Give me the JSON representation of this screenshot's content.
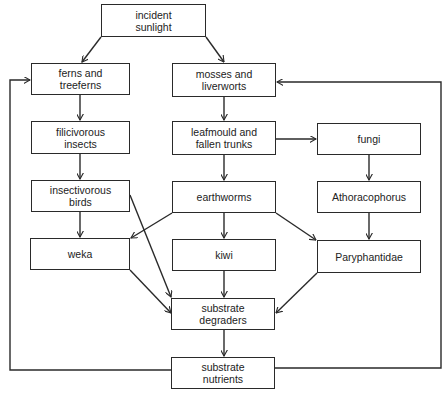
{
  "diagram": {
    "type": "flowchart",
    "title": "",
    "colors": {
      "line": "#2a2a2a",
      "box_border": "#2a2a2a",
      "text": "#222222",
      "background": "#ffffff"
    },
    "nodes": [
      {
        "id": "sunlight",
        "label": "incident\nsunlight",
        "x": 101,
        "y": 4,
        "w": 105,
        "h": 33
      },
      {
        "id": "ferns",
        "label": "ferns and\ntreeferns",
        "x": 31,
        "y": 63,
        "w": 99,
        "h": 32
      },
      {
        "id": "mosses",
        "label": "mosses and\nliverworts",
        "x": 172,
        "y": 63,
        "w": 104,
        "h": 34
      },
      {
        "id": "filicivorous",
        "label": "filicivorous\ninsects",
        "x": 31,
        "y": 121,
        "w": 99,
        "h": 33
      },
      {
        "id": "leafmould",
        "label": "leafmould and\nfallen trunks",
        "x": 172,
        "y": 121,
        "w": 104,
        "h": 34
      },
      {
        "id": "fungi",
        "label": "fungi",
        "x": 317,
        "y": 123,
        "w": 104,
        "h": 32
      },
      {
        "id": "insectivorous",
        "label": "insectivorous\nbirds",
        "x": 31,
        "y": 180,
        "w": 99,
        "h": 32
      },
      {
        "id": "earthworms",
        "label": "earthworms",
        "x": 172,
        "y": 181,
        "w": 104,
        "h": 32
      },
      {
        "id": "athoracophorus",
        "label": "Athoracophorus",
        "x": 317,
        "y": 181,
        "w": 104,
        "h": 32
      },
      {
        "id": "weka",
        "label": "weka",
        "x": 30,
        "y": 238,
        "w": 100,
        "h": 32
      },
      {
        "id": "kiwi",
        "label": "kiwi",
        "x": 172,
        "y": 239,
        "w": 104,
        "h": 32
      },
      {
        "id": "paryphantidae",
        "label": "Paryphantidae",
        "x": 317,
        "y": 240,
        "w": 104,
        "h": 33
      },
      {
        "id": "degraders",
        "label": "substrate\ndegraders",
        "x": 171,
        "y": 298,
        "w": 104,
        "h": 32
      },
      {
        "id": "nutrients",
        "label": "substrate\nnutrients",
        "x": 171,
        "y": 357,
        "w": 104,
        "h": 32
      }
    ],
    "edges": [
      {
        "from": "sunlight",
        "to": "ferns"
      },
      {
        "from": "sunlight",
        "to": "mosses"
      },
      {
        "from": "ferns",
        "to": "filicivorous"
      },
      {
        "from": "mosses",
        "to": "leafmould"
      },
      {
        "from": "filicivorous",
        "to": "insectivorous"
      },
      {
        "from": "leafmould",
        "to": "earthworms"
      },
      {
        "from": "leafmould",
        "to": "fungi"
      },
      {
        "from": "fungi",
        "to": "athoracophorus"
      },
      {
        "from": "insectivorous",
        "to": "weka"
      },
      {
        "from": "insectivorous",
        "to": "degraders"
      },
      {
        "from": "earthworms",
        "to": "weka"
      },
      {
        "from": "earthworms",
        "to": "kiwi"
      },
      {
        "from": "earthworms",
        "to": "paryphantidae"
      },
      {
        "from": "athoracophorus",
        "to": "paryphantidae"
      },
      {
        "from": "weka",
        "to": "degraders"
      },
      {
        "from": "kiwi",
        "to": "degraders"
      },
      {
        "from": "paryphantidae",
        "to": "degraders"
      },
      {
        "from": "degraders",
        "to": "nutrients"
      },
      {
        "from": "nutrients",
        "to": "ferns",
        "route": "left-loop"
      },
      {
        "from": "nutrients",
        "to": "mosses",
        "route": "right-loop"
      }
    ]
  }
}
